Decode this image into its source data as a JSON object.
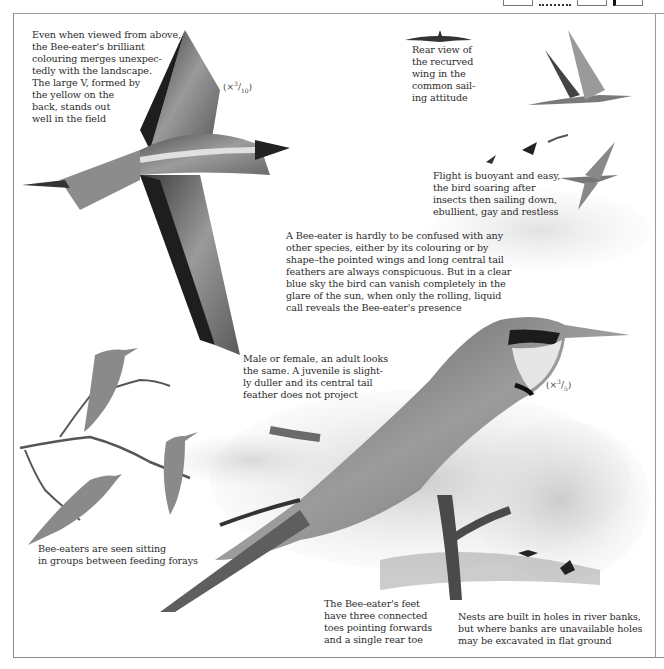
{
  "page": {
    "subject": "Bee-eater",
    "colors": {
      "ink": "#2c2c2c",
      "frame": "#8a8a8a",
      "wash": "#c9c9c9"
    }
  },
  "captions": {
    "top_left": "Even when viewed from above,\nthe Bee-eater's brilliant\ncolouring merges unexpec-\ntedly with the landscape.\nThe large V, formed by\nthe yellow on the\nback, stands out\nwell in the field",
    "rear_view": "Rear view of\nthe recurved\nwing in the\ncommon sail-\ning attitude",
    "flight": "Flight is buoyant and easy,\nthe bird soaring after\ninsects then sailing down,\nebullient, gay and restless",
    "identification": "A Bee-eater is hardly to be confused with any\nother species, either by its colouring or by\nshape–the pointed wings and long central tail\nfeathers are always conspicuous. But in a clear\nblue sky the bird can vanish completely in the\nglare of the sun, when only the rolling, liquid\ncall reveals the Bee-eater's presence",
    "sexes": "Male or female, an adult looks\nthe same. A juvenile is slight-\nly duller and its central tail\nfeather does not project",
    "groups": "Bee-eaters are seen sitting\nin groups between feeding forays",
    "feet": "The Bee-eater's feet\nhave three connected\ntoes pointing forwards\nand a single rear toe",
    "nests": "Nests are built in holes in river banks,\nbut where banks are unavailable holes\nmay be excavated in flat ground"
  },
  "scales": {
    "flying_bird": {
      "prefix": "(×",
      "num": "3",
      "den": "10",
      "suffix": ")"
    },
    "perched_bird": {
      "prefix": "(×",
      "num": "3",
      "den": "5",
      "suffix": ")"
    }
  },
  "illustrations": [
    {
      "id": "flying-from-above",
      "label": "bee-eater viewed from above in flight"
    },
    {
      "id": "rear-view-wing",
      "label": "rear view of recurved wing"
    },
    {
      "id": "sailing-bird",
      "label": "bee-eater sailing in flight"
    },
    {
      "id": "flight-sequence",
      "label": "bee-eaters in flight sequence"
    },
    {
      "id": "perched-adult",
      "label": "adult bee-eater perched on branch"
    },
    {
      "id": "group-on-branch",
      "label": "three bee-eaters perched on branch"
    },
    {
      "id": "nest-bank",
      "label": "river bank with nest holes and birds"
    }
  ]
}
